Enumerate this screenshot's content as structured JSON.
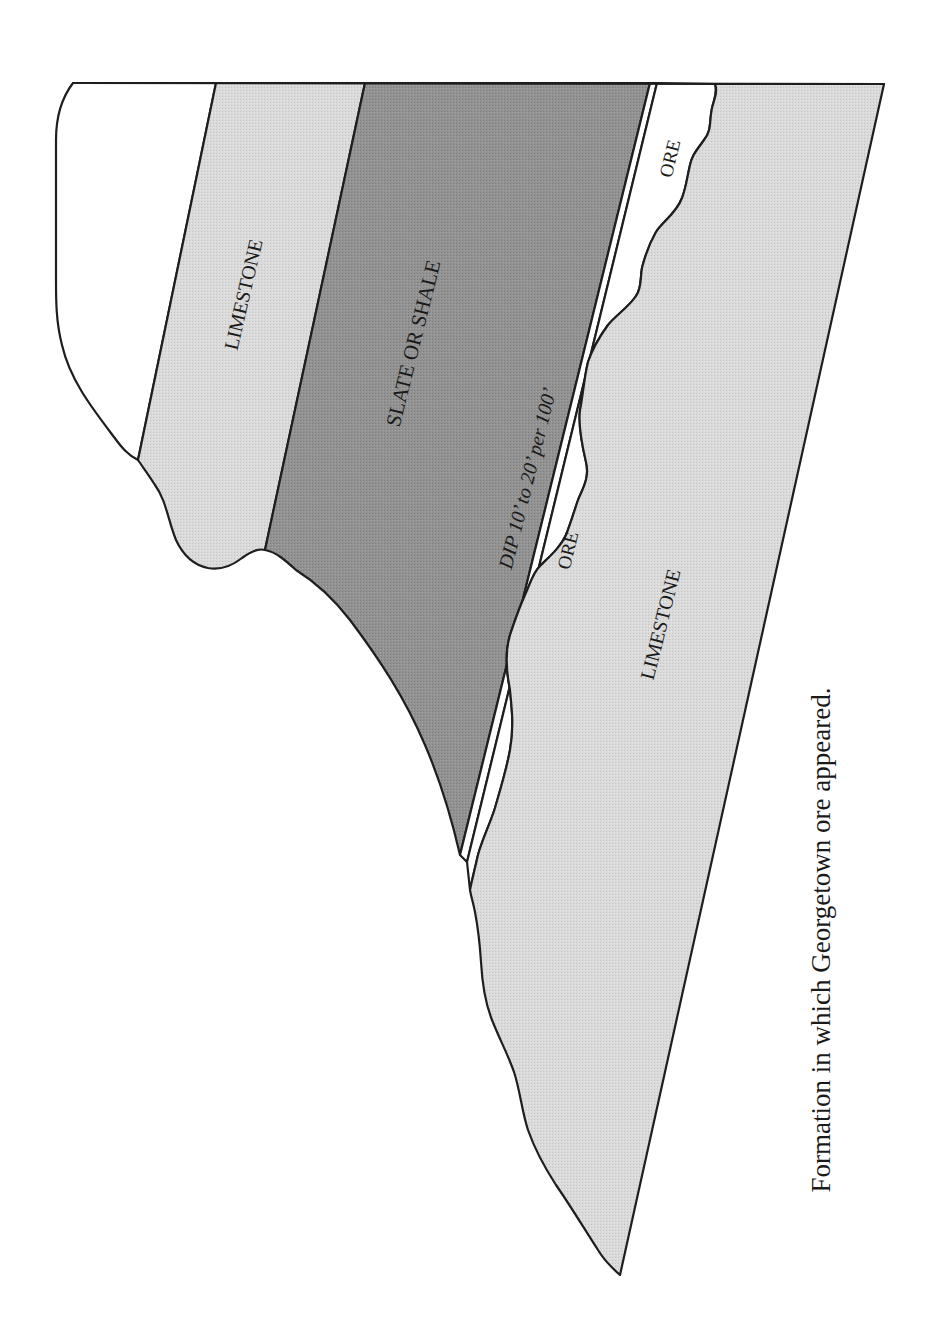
{
  "figure": {
    "caption": "Formation in which Georgetown ore appeared.",
    "layers": {
      "upper_limestone": {
        "label": "LIMESTONE",
        "fill": "#d9d9d9"
      },
      "slate": {
        "label": "SLATE OR SHALE",
        "fill": "#8f8f8f"
      },
      "ore_upper": {
        "label": "ORE",
        "fill": "#ffffff"
      },
      "ore_lower": {
        "label": "ORE",
        "fill": "#ffffff"
      },
      "lower_limestone": {
        "label": "LIMESTONE",
        "fill": "#d6d6d6"
      }
    },
    "annotations": {
      "dip": "DIP 10’ to 20’ per 100’"
    },
    "colors": {
      "outline": "#1e1e1e",
      "light_gray": "#d8d8d8",
      "dark_gray": "#8f8f8f",
      "background": "#ffffff"
    }
  }
}
